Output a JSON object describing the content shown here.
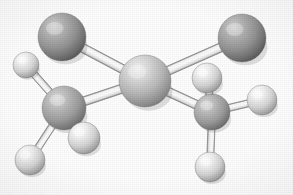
{
  "figure": {
    "kind": "ball-and-stick-molecular-model",
    "background_color": "#fefefe",
    "caption": "",
    "rendering": "grayscale scanned halftone illustration",
    "width": 293,
    "height": 195
  },
  "palette": {
    "carbon_dark": "#9a9a9a",
    "carbon_mid": "#a8a8a8",
    "carbon_light": "#c8c8c8",
    "hydrogen_light": "#e8e8e8",
    "hydrogen_highlight": "#ffffff",
    "sphere_shadow": "#4e4e4e",
    "bond_fill": "#f2f2f2",
    "bond_edge": "#8d8d8d",
    "outline": "#6f6f6f"
  },
  "atoms": [
    {
      "id": "C-upper-left",
      "element": "carbon",
      "label": "C",
      "cx": 62,
      "cy": 37,
      "r": 24,
      "shade": "dark"
    },
    {
      "id": "C-center",
      "element": "carbon",
      "label": "C",
      "cx": 145,
      "cy": 81,
      "r": 26,
      "shade": "light"
    },
    {
      "id": "C-upper-right",
      "element": "carbon",
      "label": "C",
      "cx": 242,
      "cy": 38,
      "r": 24,
      "shade": "dark"
    },
    {
      "id": "C-lower-left",
      "element": "carbon",
      "label": "C",
      "cx": 64,
      "cy": 108,
      "r": 22,
      "shade": "mid"
    },
    {
      "id": "C-lower-right",
      "element": "carbon",
      "label": "C",
      "cx": 212,
      "cy": 112,
      "r": 18,
      "shade": "mid"
    },
    {
      "id": "H-left",
      "element": "hydrogen",
      "label": "H",
      "cx": 26,
      "cy": 65,
      "r": 13,
      "shade": "white"
    },
    {
      "id": "H-bottom-left",
      "element": "hydrogen",
      "label": "H",
      "cx": 30,
      "cy": 160,
      "r": 15,
      "shade": "white"
    },
    {
      "id": "H-lower-mid",
      "element": "hydrogen",
      "label": "H",
      "cx": 84,
      "cy": 138,
      "r": 16,
      "shade": "white"
    },
    {
      "id": "H-upper-right-arm",
      "element": "hydrogen",
      "label": "H",
      "cx": 207,
      "cy": 78,
      "r": 15,
      "shade": "white"
    },
    {
      "id": "H-right",
      "element": "hydrogen",
      "label": "H",
      "cx": 262,
      "cy": 100,
      "r": 15,
      "shade": "white"
    },
    {
      "id": "H-bottom-right",
      "element": "hydrogen",
      "label": "H",
      "cx": 210,
      "cy": 167,
      "r": 15,
      "shade": "white"
    }
  ],
  "bonds": [
    {
      "id": "bond-C-upper-left--C-center",
      "from": "C-upper-left",
      "to": "C-center",
      "width": 9
    },
    {
      "id": "bond-C-center--C-upper-right",
      "from": "C-center",
      "to": "C-upper-right",
      "width": 9
    },
    {
      "id": "bond-C-lower-left--C-center",
      "from": "C-lower-left",
      "to": "C-center",
      "width": 9
    },
    {
      "id": "bond-C-center--C-lower-right",
      "from": "C-center",
      "to": "C-lower-right",
      "width": 9
    },
    {
      "id": "bond-C-lower-left--H-left",
      "from": "C-lower-left",
      "to": "H-left",
      "width": 7
    },
    {
      "id": "bond-C-lower-left--H-bottom-left",
      "from": "C-lower-left",
      "to": "H-bottom-left",
      "width": 7
    },
    {
      "id": "bond-C-lower-left--H-lower-mid",
      "from": "C-lower-left",
      "to": "H-lower-mid",
      "width": 7
    },
    {
      "id": "bond-C-lower-right--H-upper-arm",
      "from": "C-lower-right",
      "to": "H-upper-right-arm",
      "width": 7
    },
    {
      "id": "bond-C-lower-right--H-right",
      "from": "C-lower-right",
      "to": "H-right",
      "width": 7
    },
    {
      "id": "bond-C-lower-right--H-bottom",
      "from": "C-lower-right",
      "to": "H-bottom-right",
      "width": 7
    }
  ]
}
